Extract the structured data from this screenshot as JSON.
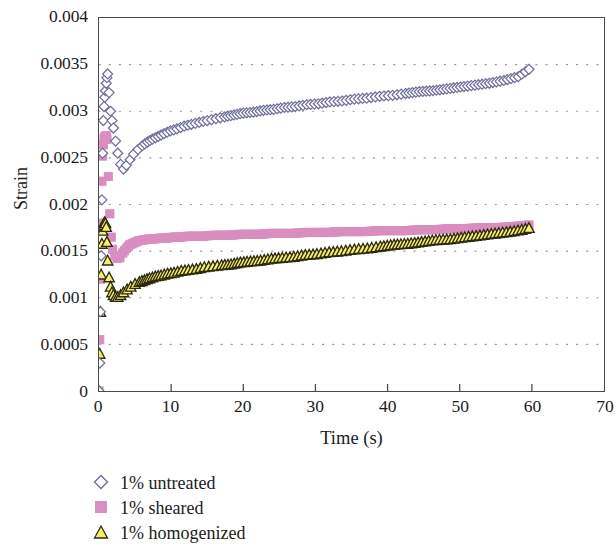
{
  "chart_data": {
    "type": "scatter",
    "title": "",
    "xlabel": "Time (s)",
    "ylabel": "Strain",
    "xlim": [
      0,
      70
    ],
    "ylim": [
      0,
      0.004
    ],
    "grid": true,
    "grid_style": "dotted-horizontal",
    "legend_position": "below-left",
    "x_ticks": [
      0,
      10,
      20,
      30,
      40,
      50,
      60,
      70
    ],
    "x_tick_labels": [
      "0",
      "10",
      "20",
      "30",
      "40",
      "50",
      "60",
      "70"
    ],
    "y_ticks": [
      0,
      0.0005,
      0.001,
      0.0015,
      0.002,
      0.0025,
      0.003,
      0.0035,
      0.004
    ],
    "y_tick_labels": [
      "0",
      "0.0005",
      "0.001",
      "0.0015",
      "0.002",
      "0.0025",
      "0.003",
      "0.0035",
      "0.004"
    ],
    "series": [
      {
        "name": "1% untreated",
        "marker": "diamond",
        "marker_fill": "#ffffff",
        "marker_edge": "#6f6f9c",
        "x": [
          0.0,
          0.1,
          0.2,
          0.3,
          0.4,
          0.5,
          0.6,
          0.7,
          0.8,
          0.9,
          1.0,
          1.1,
          1.2,
          1.4,
          1.6,
          1.8,
          2.0,
          2.3,
          2.6,
          3.0,
          3.4,
          3.8,
          4.3,
          4.8,
          5.4,
          6.0,
          6.7,
          7.4,
          8.2,
          9.0,
          9.9,
          10.8,
          11.8,
          12.8,
          13.9,
          15.0,
          16.2,
          17.4,
          18.7,
          20.0,
          21.4,
          22.8,
          24.2,
          25.7,
          27.2,
          28.8,
          30.4,
          32.0,
          33.7,
          35.4,
          37.1,
          38.9,
          40.7,
          42.5,
          44.4,
          46.3,
          48.2,
          50.1,
          52.1,
          54.1,
          56.1,
          58.1,
          59.6
        ],
        "y": [
          0.0,
          0.0003,
          0.00085,
          0.00145,
          0.00205,
          0.00255,
          0.0029,
          0.00305,
          0.00315,
          0.00322,
          0.0033,
          0.00336,
          0.0034,
          0.0032,
          0.003,
          0.0029,
          0.00282,
          0.00268,
          0.00255,
          0.00243,
          0.00238,
          0.00242,
          0.00248,
          0.00254,
          0.00259,
          0.00263,
          0.00267,
          0.0027,
          0.00273,
          0.00276,
          0.00279,
          0.00281,
          0.00284,
          0.00286,
          0.00288,
          0.0029,
          0.00292,
          0.00294,
          0.00296,
          0.00298,
          0.00299,
          0.00301,
          0.00302,
          0.00304,
          0.00305,
          0.00307,
          0.00308,
          0.0031,
          0.00311,
          0.00313,
          0.00314,
          0.00316,
          0.00317,
          0.00319,
          0.00321,
          0.00322,
          0.00324,
          0.00326,
          0.00328,
          0.0033,
          0.00333,
          0.00337,
          0.00345
        ]
      },
      {
        "name": "1% sheared",
        "marker": "square",
        "marker_fill": "#d98ec0",
        "marker_edge": "#d98ec0",
        "x": [
          0.0,
          0.1,
          0.2,
          0.3,
          0.4,
          0.5,
          0.6,
          0.7,
          0.8,
          0.9,
          1.0,
          1.1,
          1.3,
          1.5,
          1.7,
          1.9,
          2.2,
          2.5,
          2.9,
          3.3,
          3.8,
          4.3,
          4.9,
          5.5,
          6.2,
          6.9,
          7.7,
          8.5,
          9.4,
          10.3,
          11.3,
          12.3,
          13.4,
          14.5,
          15.7,
          16.9,
          18.2,
          19.5,
          20.9,
          22.3,
          23.8,
          25.3,
          26.9,
          28.5,
          30.1,
          31.8,
          33.5,
          35.3,
          37.1,
          38.9,
          40.8,
          42.7,
          44.6,
          46.6,
          48.6,
          50.6,
          52.6,
          54.7,
          56.8,
          58.5,
          59.6
        ],
        "y": [
          0.0,
          0.00055,
          0.0012,
          0.0018,
          0.00225,
          0.00252,
          0.00264,
          0.0027,
          0.00272,
          0.00273,
          0.00274,
          0.0027,
          0.0023,
          0.0019,
          0.00165,
          0.00152,
          0.00145,
          0.00142,
          0.00143,
          0.00148,
          0.00153,
          0.00157,
          0.00159,
          0.00161,
          0.00162,
          0.00163,
          0.00163,
          0.00164,
          0.00164,
          0.00165,
          0.00165,
          0.00166,
          0.00166,
          0.00166,
          0.00167,
          0.00167,
          0.00167,
          0.00168,
          0.00168,
          0.00168,
          0.00169,
          0.00169,
          0.00169,
          0.0017,
          0.0017,
          0.0017,
          0.00171,
          0.00171,
          0.00171,
          0.00172,
          0.00172,
          0.00172,
          0.00173,
          0.00173,
          0.00174,
          0.00174,
          0.00175,
          0.00175,
          0.00176,
          0.00177,
          0.00178
        ]
      },
      {
        "name": "1% homogenized",
        "marker": "triangle",
        "marker_fill": "#f4ee6b",
        "marker_edge": "#2e2a10",
        "x": [
          0.0,
          0.1,
          0.2,
          0.3,
          0.4,
          0.5,
          0.6,
          0.7,
          0.8,
          0.9,
          1.0,
          1.1,
          1.2,
          1.4,
          1.6,
          1.8,
          2.0,
          2.3,
          2.6,
          3.0,
          3.4,
          3.9,
          4.4,
          5.0,
          5.6,
          6.3,
          7.0,
          7.8,
          8.6,
          9.5,
          10.4,
          11.4,
          12.4,
          13.5,
          14.6,
          15.8,
          17.0,
          18.3,
          19.6,
          21.0,
          22.4,
          23.9,
          25.4,
          27.0,
          28.6,
          30.2,
          31.9,
          33.6,
          35.4,
          37.2,
          39.0,
          40.9,
          42.8,
          44.7,
          46.7,
          48.7,
          50.7,
          52.8,
          54.9,
          57.0,
          58.6,
          59.6
        ],
        "y": [
          0.0,
          0.0004,
          0.00085,
          0.00125,
          0.00158,
          0.00172,
          0.00178,
          0.0018,
          0.00181,
          0.0018,
          0.00176,
          0.0016,
          0.0014,
          0.00122,
          0.00112,
          0.00106,
          0.00103,
          0.00101,
          0.00101,
          0.00103,
          0.00106,
          0.00109,
          0.00112,
          0.00115,
          0.00117,
          0.00119,
          0.00121,
          0.00123,
          0.00124,
          0.00126,
          0.00127,
          0.00129,
          0.0013,
          0.00131,
          0.00133,
          0.00134,
          0.00135,
          0.00136,
          0.00138,
          0.00139,
          0.0014,
          0.00142,
          0.00143,
          0.00144,
          0.00146,
          0.00147,
          0.00149,
          0.0015,
          0.00152,
          0.00153,
          0.00155,
          0.00157,
          0.00158,
          0.0016,
          0.00162,
          0.00163,
          0.00165,
          0.00167,
          0.00169,
          0.00171,
          0.00173,
          0.00175
        ]
      }
    ]
  },
  "axes": {
    "y_title": "Strain",
    "x_title": "Time (s)"
  },
  "legend": {
    "items": [
      {
        "label": "1% untreated"
      },
      {
        "label": "1% sheared"
      },
      {
        "label": "1% homogenized"
      }
    ]
  },
  "colors": {
    "untreated_edge": "#6f6f9c",
    "untreated_fill": "#ffffff",
    "sheared": "#d98ec0",
    "homogenized_fill": "#f4ee6b",
    "homogenized_edge": "#2e2a10",
    "axis": "#4a4a4a",
    "grid": "#9a9a9a",
    "text": "#1b1b1b"
  }
}
